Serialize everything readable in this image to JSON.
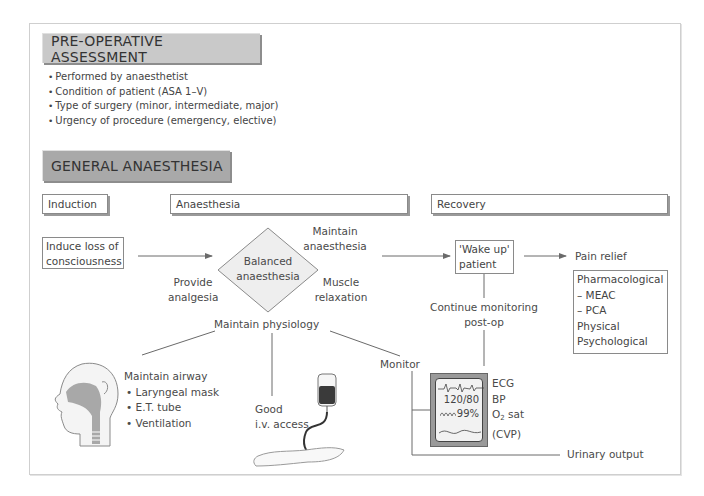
{
  "preop": {
    "title": "PRE-OPERATIVE ASSESSMENT",
    "bullets": [
      "Performed by anaesthetist",
      "Condition of patient (ASA 1–V)",
      "Type of surgery (minor, intermediate, major)",
      "Urgency of procedure (emergency, elective)"
    ]
  },
  "general": {
    "title": "GENERAL ANAESTHESIA"
  },
  "phases": {
    "induction": "Induction",
    "anaesthesia": "Anaesthesia",
    "recovery": "Recovery"
  },
  "flow": {
    "induce": [
      "Induce loss of",
      "consciousness"
    ],
    "balanced": [
      "Balanced",
      "anaesthesia"
    ],
    "provide": [
      "Provide",
      "analgesia"
    ],
    "maintain_anaesthesia": [
      "Maintain",
      "anaesthesia"
    ],
    "muscle": [
      "Muscle",
      "relaxation"
    ],
    "maintain_physiology": "Maintain physiology",
    "wake_up": [
      "'Wake up'",
      "patient"
    ],
    "pain_relief": "Pain relief",
    "pain_options": [
      "Pharmacological",
      "– MEAC",
      "– PCA",
      "Physical",
      "Psychological"
    ],
    "continue_monitoring": [
      "Continue monitoring",
      "post-op"
    ]
  },
  "airway": {
    "title": "Maintain airway",
    "items": [
      "Laryngeal mask",
      "E.T. tube",
      "Ventilation"
    ]
  },
  "iv": [
    "Good",
    "i.v. access"
  ],
  "monitor": {
    "label": "Monitor",
    "screen_bp": "120/80",
    "screen_sat": "99%",
    "params": [
      "ECG",
      "BP",
      "O",
      "2",
      " sat",
      "(CVP)"
    ],
    "urinary": "Urinary output"
  },
  "colors": {
    "header_light": "#c9c9c9",
    "header_dark": "#a9a9a9",
    "line": "#6a6a6a",
    "monitor_frame": "#9a9a9a",
    "screen": "#f2f2f2"
  }
}
